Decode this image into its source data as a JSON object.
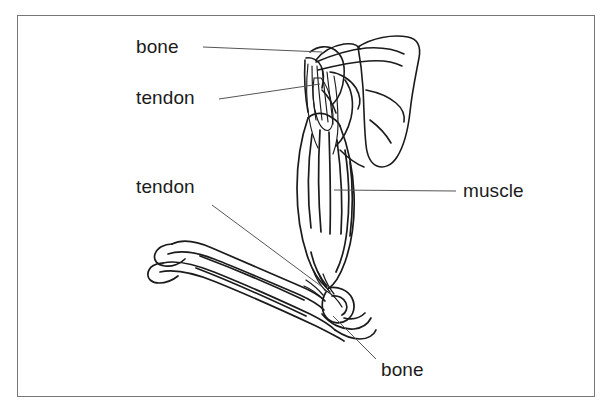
{
  "figure": {
    "background_color": "#ffffff",
    "frame_color": "#777777",
    "ink_color": "#1b1b1b",
    "leader_color": "#555555"
  },
  "labels": [
    {
      "id": "bone-top",
      "text": "bone",
      "x": 136,
      "y": 37,
      "leader": {
        "x1": 203,
        "y1": 47,
        "x2": 322,
        "y2": 52
      }
    },
    {
      "id": "tendon-top",
      "text": "tendon",
      "x": 136,
      "y": 88,
      "leader": {
        "x1": 219,
        "y1": 99,
        "x2": 320,
        "y2": 84
      }
    },
    {
      "id": "tendon-lower",
      "text": "tendon",
      "x": 136,
      "y": 177,
      "leader": {
        "x1": 212,
        "y1": 205,
        "x2": 321,
        "y2": 286
      }
    },
    {
      "id": "muscle",
      "text": "muscle",
      "x": 463,
      "y": 181,
      "leader": {
        "x1": 334,
        "y1": 190,
        "x2": 456,
        "y2": 191
      }
    },
    {
      "id": "bone-bottom",
      "text": "bone",
      "x": 381,
      "y": 360,
      "leader": {
        "x1": 333,
        "y1": 316,
        "x2": 376,
        "y2": 359
      }
    }
  ],
  "anatomy_parts": [
    "scapula",
    "humerus-head",
    "muscle-belly",
    "upper-tendon",
    "lower-tendon",
    "elbow-joint",
    "radius",
    "ulna"
  ]
}
